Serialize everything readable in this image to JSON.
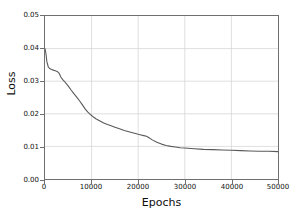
{
  "chart_data": {
    "type": "line",
    "title": "",
    "xlabel": "Epochs",
    "ylabel": "Loss",
    "xlim": [
      0,
      50000
    ],
    "ylim": [
      0.0,
      0.05
    ],
    "grid": true,
    "legend": null,
    "line_color": "#595959",
    "xticks": [
      0,
      10000,
      20000,
      30000,
      40000,
      50000
    ],
    "xtick_labels": [
      "0",
      "10000",
      "20000",
      "30000",
      "40000",
      "50000"
    ],
    "yticks": [
      0.0,
      0.01,
      0.02,
      0.03,
      0.04,
      0.05
    ],
    "ytick_labels": [
      "0.00",
      "0.01",
      "0.02",
      "0.03",
      "0.04",
      "0.05"
    ],
    "series": [
      {
        "name": "Loss",
        "x": [
          0,
          200,
          400,
          700,
          1000,
          1400,
          1800,
          2200,
          2600,
          3000,
          3400,
          3800,
          4200,
          4600,
          5000,
          5600,
          6200,
          6800,
          7400,
          8000,
          8600,
          9200,
          9800,
          10400,
          11000,
          11800,
          12600,
          13400,
          14200,
          15000,
          16000,
          17000,
          18000,
          19000,
          20000,
          20600,
          21200,
          21800,
          22400,
          23000,
          24000,
          25000,
          26000,
          27000,
          28000,
          29000,
          30000,
          32000,
          34000,
          36000,
          38000,
          40000,
          42000,
          44000,
          46000,
          48000,
          50000
        ],
        "y": [
          0.04,
          0.0385,
          0.036,
          0.0344,
          0.0339,
          0.0336,
          0.0334,
          0.0332,
          0.033,
          0.0325,
          0.0313,
          0.0305,
          0.0299,
          0.0292,
          0.0285,
          0.0273,
          0.0262,
          0.0251,
          0.024,
          0.0228,
          0.0215,
          0.0205,
          0.0197,
          0.019,
          0.0184,
          0.0178,
          0.0172,
          0.0167,
          0.0163,
          0.0159,
          0.0154,
          0.0149,
          0.0145,
          0.0141,
          0.0137,
          0.0135,
          0.0133,
          0.0131,
          0.0126,
          0.012,
          0.0113,
          0.0107,
          0.0103,
          0.01,
          0.0098,
          0.0096,
          0.0095,
          0.0093,
          0.0091,
          0.009,
          0.0089,
          0.0088,
          0.0087,
          0.0086,
          0.0085,
          0.0085,
          0.0084
        ]
      }
    ]
  }
}
